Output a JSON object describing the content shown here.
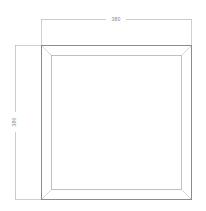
{
  "drawing": {
    "type": "technical-plan-view",
    "subject": "square-panel-frame",
    "background_color": "#ffffff",
    "line_color": "#9a9a9a",
    "outline_color": "#8c8c8c",
    "miter_color": "#b4b4b4",
    "dimension_line_color": "#a8a8a8",
    "text_color": "#8a8a8a",
    "dimensions": {
      "top": {
        "label": "380",
        "orientation": "horizontal",
        "position": "above-top-edge"
      },
      "left": {
        "label": "380",
        "orientation": "vertical-rotated",
        "position": "left-of-left-edge"
      }
    },
    "geometry": {
      "outer": {
        "x": 41,
        "y": 45,
        "width": 151,
        "height": 154
      },
      "inner": {
        "x": 51,
        "y": 55,
        "width": 131,
        "height": 134
      },
      "frame_band_width": 10,
      "corner_style": "mitered-45-degree"
    }
  }
}
